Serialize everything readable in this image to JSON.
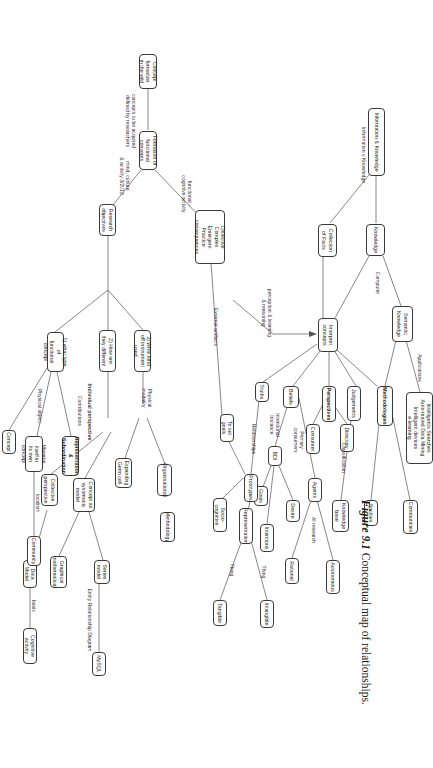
{
  "figure": {
    "number": "Figure 9.1",
    "caption": "Conceptual map of relationships.",
    "orientation_deg": 90
  },
  "diagram": {
    "type": "concept-map",
    "title": "Conceptual map of relationships",
    "nodes": {
      "information_knowledge": "Information & Knowledge",
      "knowledge": "Knowledge",
      "collection_of_facts": "Collection\nof Facts",
      "semantic_knowledge": "Semantic\nKnowledge",
      "applications_box": "Intelligents Searches\nAuto-mated Data Mining\nIntelligent devices\ne-learning",
      "interpret_concepts": "Interpret\nconcepts",
      "methodologies": "Methodologies",
      "communities": "Communities",
      "socities": "Socities",
      "judgements": "Judgements",
      "knowledge_base": "Knowledge\nbase",
      "perspectives": "Perspectives",
      "directory": "Directory",
      "consumer": "Consumer",
      "agents": "Agents",
      "autonomous": "Autonomous",
      "rational": "Rational",
      "beliefs": "Beliefs",
      "bdi": "BDI",
      "desire": "Desire",
      "goals": "Goals",
      "intentions": "Intentions",
      "truths": "Truths",
      "prototypes": "Prototypes",
      "representation": "Representation",
      "intangible": "Intangible",
      "tangible": "Tangible",
      "to_set_goals": "To set goals",
      "socio_cognitive": "Socio-cognitive",
      "methodology": "Methodology",
      "organisational": "Organisational",
      "expanding_germ_cell": "Expanding\nGerm cell",
      "collective_complex": "Collective\nComplex\nEmergent\nPractice consequences",
      "concept_formation": "Concept formation\nin the wild",
      "formation_functional": "Formation of\nfunctional concepts",
      "research_objectives": "Research\nobjectives",
      "q3": "3) What kind\noff instrument used",
      "q2": "2) How are\nthey different",
      "q1": "1) what type of\nfunctional concept",
      "concept_epistemic": "Concept as\nsystematic\nmodel",
      "series_model": "Series\nmodel",
      "graphical_math": "Graphical\nmathematical",
      "mysql": "MySQL",
      "collective_perspective": "Collective\nperspective",
      "data_model": "Data Model",
      "cognitive_activity": "Cognitive activity",
      "representation_subordination": "Representation &\nSubordination",
      "material_itself": "Material itself in\nits own concept",
      "community": "Community",
      "concept": "Concept"
    },
    "edge_labels": {
      "information_v_knowledge": "Information v Knowledge",
      "computer": "Computer",
      "applications": "Applications",
      "classification": "Classification",
      "primary_consumers": "Primary\nconsumers",
      "ai_research": "AI research",
      "intentional_instance": "Intentional\nInstance",
      "relationships": "Relationships",
      "thing_1": "Thing",
      "thing_2": "Thing",
      "perception_learning_reasoning": "perception & learning\n& reasoning",
      "external_artifacts": "External artifacts",
      "functional_cognitive_activity": "functional ~\ncognitive activity",
      "concepts_acquired": "concepts to be acquired\ndefined by researchers",
      "mind_culture_activity": "mind, culture\n& activity 3/2012",
      "physical_modality": "Physical\nmodality",
      "individual_perspective": "Individual perspective",
      "contributions": "Contributions",
      "physical_object": "Physical object",
      "localism": "localism",
      "basic": "basic",
      "entity_relationship_diagram": "Entity Relationship Diagram"
    },
    "colors": {
      "node_border": "#3a3a3a",
      "edge": "#555555",
      "text": "#222222",
      "background": "#ffffff"
    }
  }
}
